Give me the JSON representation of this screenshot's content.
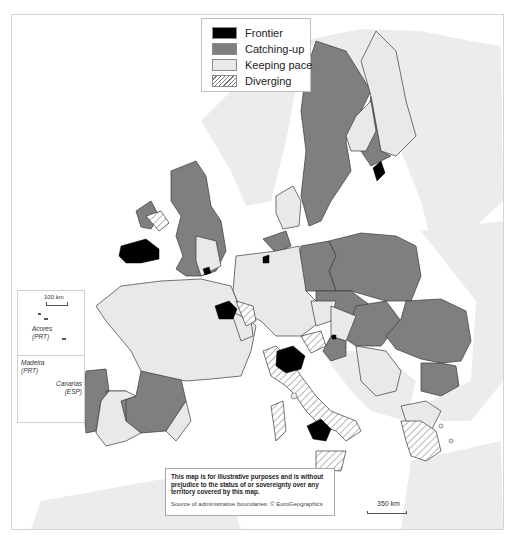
{
  "legend": {
    "items": [
      {
        "label": "Frontier",
        "pattern": "solid",
        "color": "#000000"
      },
      {
        "label": "Catching-up",
        "pattern": "solid",
        "color": "#7f7f7f"
      },
      {
        "label": "Keeping pace",
        "pattern": "solid",
        "color": "#e9e9e9"
      },
      {
        "label": "Diverging",
        "pattern": "hatched",
        "color": "#ffffff"
      }
    ]
  },
  "insets": {
    "azores": {
      "scale_label": "100 km",
      "name": "Acores",
      "country": "(PRT)"
    },
    "madeira": {
      "name": "Madeira",
      "country": "(PRT)"
    },
    "canarias": {
      "name": "Canarias",
      "country": "(ESP)"
    }
  },
  "disclaimer": {
    "text": "This map is for illustrative purposes and is without prejudice to the status of or sovereignty over any territory covered by this map.",
    "source": "Source of administrative boundaries: © EuroGeographics"
  },
  "scale_bar": {
    "label": "350 km"
  },
  "colors": {
    "frontier": "#000000",
    "catching_up": "#7f7f7f",
    "keeping_pace": "#e9e9e9",
    "diverging": "#ffffff",
    "non_eu_land": "#ececec",
    "sea": "#ffffff",
    "border": "#3a3a3a"
  }
}
